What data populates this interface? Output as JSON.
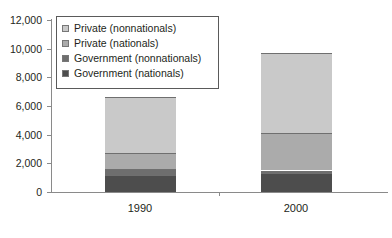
{
  "chart_data": {
    "type": "bar",
    "stacked": true,
    "title": "",
    "xlabel": "",
    "ylabel": "",
    "categories": [
      "1990",
      "2000"
    ],
    "ylim": [
      0,
      12000
    ],
    "yticks": [
      0,
      2000,
      4000,
      6000,
      8000,
      10000,
      12000
    ],
    "ytick_labels": [
      "0",
      "2,000",
      "4,000",
      "6,000",
      "8,000",
      "10,000",
      "12,000"
    ],
    "grid": false,
    "legend_position": "top-left",
    "series": [
      {
        "name": "Government (nationals)",
        "color": "#4d4d4d",
        "values": [
          1200,
          1300
        ]
      },
      {
        "name": "Government (nonnationals)",
        "color": "#6e6e6e",
        "values": [
          400,
          200
        ]
      },
      {
        "name": "Private (nationals)",
        "color": "#ababab",
        "values": [
          1100,
          2600
        ]
      },
      {
        "name": "Private (nonnationals)",
        "color": "#c9c9c9",
        "values": [
          3900,
          5600
        ]
      }
    ],
    "totals": [
      6600,
      9700
    ]
  },
  "legend": {
    "items": [
      {
        "label": "Private (nonnationals)",
        "color": "#c9c9c9"
      },
      {
        "label": "Private (nationals)",
        "color": "#ababab"
      },
      {
        "label": "Government (nonnationals)",
        "color": "#6e6e6e"
      },
      {
        "label": "Government (nationals)",
        "color": "#4d4d4d"
      }
    ]
  },
  "axis": {
    "y_labels": [
      "12,000",
      "10,000",
      "8,000",
      "6,000",
      "4,000",
      "2,000",
      "0"
    ],
    "x_labels": [
      "1990",
      "2000"
    ]
  }
}
